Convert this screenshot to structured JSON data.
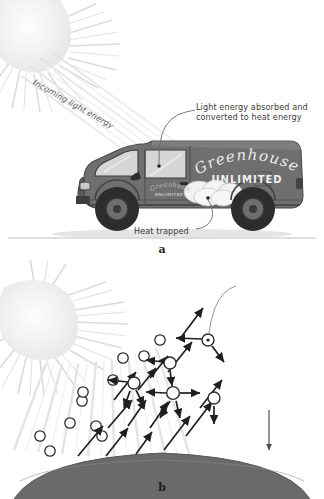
{
  "figure": {
    "panels": [
      {
        "letter": "a",
        "name": "car-greenhouse-analogy",
        "labels": {
          "incoming": "Incoming light energy",
          "absorbed_line1": "Light energy absorbed and",
          "absorbed_line2": "converted to heat energy",
          "heat_trapped": "Heat trapped"
        },
        "van": {
          "brand_script": "Greenhouses",
          "brand_block": "UNLIMITED",
          "door_script": "Greenhouses",
          "door_block": "UNLIMITED"
        }
      },
      {
        "letter": "b",
        "name": "atmospheric-greenhouse-effect",
        "labels": {
          "incoming": "Incoming light energy",
          "outgoing": "Outgoing infrared energy",
          "co2_line1": "Carbon dioxide",
          "co2_line2": "and other",
          "co2_line3": "greenhouse",
          "co2_line4": "gases",
          "absorption_line1": "Absorption by",
          "absorption_line2": "carbon dioxide",
          "absorption_line3": "and other",
          "absorption_line4": "greenhouse",
          "absorption_line5": "gases",
          "atmospheric_warming": "Atmospheric warming",
          "earth": "Earth"
        }
      }
    ],
    "icons": {
      "sun": "sun-icon",
      "van": "van-icon",
      "molecule": "gas-molecule-icon",
      "arrow": "energy-arrow-icon",
      "earth_dome": "earth-surface-icon",
      "leader_line": "callout-leader-line-icon"
    },
    "colors": {
      "background": "#ffffff",
      "sun": "#f0f0f0",
      "sun_ray": "#dcdcdc",
      "van_body": "#6f6f6f",
      "van_dark": "#3a3a3a",
      "van_window": "#d9d9d9",
      "heat_cloud": "#f2f2f2",
      "earth": "#6a6a6a",
      "text": "#3b3b3b",
      "arrow": "#1f1f1f",
      "light_beam": "#e4e4e4",
      "ground_line": "#bdbdbd"
    }
  }
}
